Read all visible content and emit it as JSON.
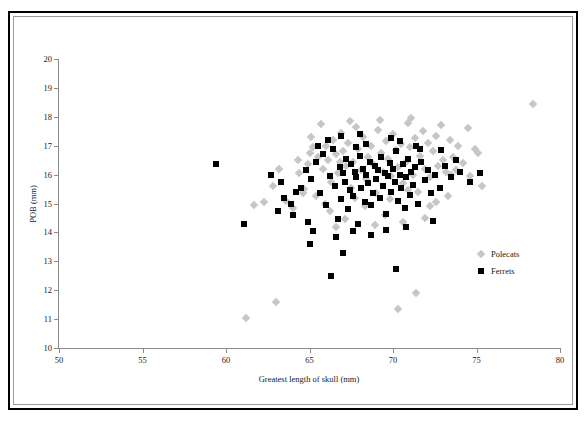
{
  "chart_data": {
    "type": "scatter",
    "title": "",
    "xlabel": "Greatest length of skull (mm)",
    "ylabel": "POB (mm)",
    "xlim": [
      50,
      80
    ],
    "ylim": [
      10,
      20
    ],
    "xticks": [
      50,
      55,
      60,
      65,
      70,
      75,
      80
    ],
    "yticks": [
      10,
      11,
      12,
      13,
      14,
      15,
      16,
      17,
      18,
      19,
      20
    ],
    "grid": false,
    "legend_position": "middle-right",
    "colors": {
      "polecats": "#c6c6c6",
      "ferrets": "#000000",
      "axis": "#8a8a8a",
      "frame": "#000000"
    },
    "series": [
      {
        "name": "Polecats",
        "marker": "diamond",
        "color": "#c6c6c6",
        "points": [
          [
            78.4,
            18.45
          ],
          [
            75.3,
            15.6
          ],
          [
            74.9,
            16.9
          ],
          [
            74.5,
            17.6
          ],
          [
            74.2,
            16.4
          ],
          [
            73.9,
            17.0
          ],
          [
            73.6,
            16.6
          ],
          [
            73.4,
            17.2
          ],
          [
            73.2,
            16.1
          ],
          [
            73.0,
            16.5
          ],
          [
            72.9,
            17.7
          ],
          [
            72.7,
            16.3
          ],
          [
            72.6,
            17.35
          ],
          [
            72.4,
            16.8
          ],
          [
            72.2,
            15.9
          ],
          [
            72.1,
            17.1
          ],
          [
            71.9,
            16.2
          ],
          [
            71.8,
            17.5
          ],
          [
            71.6,
            16.65
          ],
          [
            71.5,
            15.4
          ],
          [
            71.3,
            17.25
          ],
          [
            71.2,
            16.0
          ],
          [
            71.0,
            16.95
          ],
          [
            70.9,
            17.8
          ],
          [
            70.8,
            16.45
          ],
          [
            70.6,
            15.7
          ],
          [
            70.5,
            17.05
          ],
          [
            70.3,
            16.25
          ],
          [
            70.2,
            16.85
          ],
          [
            70.0,
            17.4
          ],
          [
            69.9,
            15.95
          ],
          [
            69.7,
            16.55
          ],
          [
            69.6,
            17.15
          ],
          [
            69.4,
            16.1
          ],
          [
            69.3,
            16.75
          ],
          [
            69.1,
            17.55
          ],
          [
            69.0,
            15.35
          ],
          [
            68.8,
            16.35
          ],
          [
            68.7,
            17.0
          ],
          [
            68.5,
            16.6
          ],
          [
            68.4,
            15.85
          ],
          [
            68.2,
            17.3
          ],
          [
            68.1,
            16.15
          ],
          [
            67.9,
            16.9
          ],
          [
            67.8,
            17.65
          ],
          [
            67.6,
            16.45
          ],
          [
            67.5,
            15.55
          ],
          [
            67.3,
            17.1
          ],
          [
            67.2,
            16.3
          ],
          [
            67.0,
            16.8
          ],
          [
            66.9,
            17.45
          ],
          [
            66.7,
            16.05
          ],
          [
            66.6,
            16.7
          ],
          [
            66.4,
            17.2
          ],
          [
            66.3,
            15.75
          ],
          [
            66.1,
            16.5
          ],
          [
            66.0,
            17.0
          ],
          [
            65.8,
            16.2
          ],
          [
            65.7,
            17.75
          ],
          [
            65.5,
            16.6
          ],
          [
            65.4,
            15.25
          ],
          [
            65.2,
            16.95
          ],
          [
            65.1,
            17.3
          ],
          [
            64.9,
            16.35
          ],
          [
            64.7,
            15.5
          ],
          [
            64.4,
            16.05
          ],
          [
            64.0,
            14.85
          ],
          [
            63.6,
            15.1
          ],
          [
            63.2,
            16.2
          ],
          [
            62.8,
            15.6
          ],
          [
            62.3,
            15.05
          ],
          [
            61.7,
            14.95
          ],
          [
            61.2,
            11.05
          ],
          [
            63.0,
            11.6
          ],
          [
            71.4,
            11.9
          ],
          [
            70.3,
            11.35
          ],
          [
            70.6,
            14.35
          ],
          [
            71.9,
            14.5
          ],
          [
            69.5,
            14.6
          ],
          [
            68.3,
            14.9
          ],
          [
            67.1,
            14.45
          ],
          [
            66.2,
            14.75
          ],
          [
            72.6,
            15.05
          ],
          [
            73.3,
            15.25
          ],
          [
            69.8,
            15.15
          ],
          [
            67.7,
            15.2
          ],
          [
            65.9,
            15.0
          ],
          [
            64.6,
            15.35
          ],
          [
            73.8,
            16.15
          ],
          [
            74.6,
            15.95
          ],
          [
            75.1,
            16.75
          ],
          [
            72.2,
            14.9
          ],
          [
            68.9,
            14.25
          ],
          [
            70.9,
            15.45
          ],
          [
            66.6,
            14.2
          ],
          [
            69.2,
            17.9
          ],
          [
            67.4,
            17.85
          ],
          [
            71.1,
            17.95
          ],
          [
            73.5,
            16.0
          ],
          [
            64.3,
            16.5
          ],
          [
            65.0,
            16.75
          ],
          [
            66.8,
            16.45
          ]
        ]
      },
      {
        "name": "Ferrets",
        "marker": "square",
        "color": "#000000",
        "points": [
          [
            59.4,
            16.35
          ],
          [
            61.1,
            14.3
          ],
          [
            62.7,
            16.0
          ],
          [
            63.1,
            14.75
          ],
          [
            63.5,
            15.2
          ],
          [
            64.0,
            14.6
          ],
          [
            64.5,
            15.55
          ],
          [
            64.8,
            16.15
          ],
          [
            65.1,
            15.85
          ],
          [
            65.4,
            16.45
          ],
          [
            65.6,
            15.35
          ],
          [
            65.8,
            16.7
          ],
          [
            66.0,
            14.95
          ],
          [
            66.2,
            15.95
          ],
          [
            66.4,
            16.9
          ],
          [
            66.5,
            15.6
          ],
          [
            66.7,
            14.45
          ],
          [
            66.8,
            16.25
          ],
          [
            66.9,
            15.15
          ],
          [
            67.0,
            16.05
          ],
          [
            67.1,
            15.75
          ],
          [
            67.2,
            16.55
          ],
          [
            67.3,
            14.8
          ],
          [
            67.4,
            15.45
          ],
          [
            67.5,
            16.35
          ],
          [
            67.6,
            15.25
          ],
          [
            67.7,
            16.1
          ],
          [
            67.8,
            15.9
          ],
          [
            67.9,
            14.3
          ],
          [
            68.0,
            16.65
          ],
          [
            68.1,
            15.55
          ],
          [
            68.2,
            16.2
          ],
          [
            68.3,
            15.05
          ],
          [
            68.4,
            16.0
          ],
          [
            68.5,
            15.7
          ],
          [
            68.6,
            16.45
          ],
          [
            68.7,
            14.95
          ],
          [
            68.8,
            15.35
          ],
          [
            68.9,
            16.3
          ],
          [
            69.0,
            15.85
          ],
          [
            69.1,
            16.15
          ],
          [
            69.2,
            15.2
          ],
          [
            69.3,
            16.6
          ],
          [
            69.4,
            15.6
          ],
          [
            69.5,
            16.05
          ],
          [
            69.6,
            14.65
          ],
          [
            69.7,
            15.95
          ],
          [
            69.8,
            16.4
          ],
          [
            69.9,
            15.4
          ],
          [
            70.0,
            16.2
          ],
          [
            70.1,
            15.75
          ],
          [
            70.2,
            16.8
          ],
          [
            70.3,
            15.1
          ],
          [
            70.4,
            16.0
          ],
          [
            70.5,
            15.55
          ],
          [
            70.6,
            16.35
          ],
          [
            70.7,
            14.85
          ],
          [
            70.8,
            15.9
          ],
          [
            70.9,
            16.55
          ],
          [
            71.0,
            15.3
          ],
          [
            71.1,
            16.1
          ],
          [
            71.2,
            15.65
          ],
          [
            71.3,
            16.25
          ],
          [
            71.5,
            15.0
          ],
          [
            71.7,
            16.45
          ],
          [
            71.9,
            15.8
          ],
          [
            72.1,
            16.15
          ],
          [
            72.3,
            15.35
          ],
          [
            72.5,
            16.0
          ],
          [
            72.8,
            15.55
          ],
          [
            73.1,
            16.3
          ],
          [
            73.5,
            15.9
          ],
          [
            74.0,
            16.1
          ],
          [
            74.6,
            15.75
          ],
          [
            75.2,
            16.05
          ],
          [
            66.3,
            12.5
          ],
          [
            70.2,
            12.75
          ],
          [
            67.0,
            13.3
          ],
          [
            65.2,
            14.05
          ],
          [
            66.6,
            13.85
          ],
          [
            68.7,
            13.9
          ],
          [
            69.6,
            14.1
          ],
          [
            64.9,
            14.35
          ],
          [
            63.9,
            15.0
          ],
          [
            65.5,
            17.0
          ],
          [
            66.9,
            17.35
          ],
          [
            68.4,
            17.05
          ],
          [
            70.4,
            17.15
          ],
          [
            71.6,
            16.9
          ],
          [
            72.9,
            16.85
          ],
          [
            64.2,
            15.4
          ],
          [
            63.3,
            15.75
          ],
          [
            67.6,
            14.05
          ],
          [
            70.8,
            14.2
          ],
          [
            72.4,
            14.4
          ],
          [
            65.0,
            13.6
          ],
          [
            68.0,
            17.4
          ],
          [
            69.9,
            17.25
          ],
          [
            73.8,
            16.5
          ],
          [
            66.1,
            17.2
          ],
          [
            67.8,
            16.95
          ],
          [
            71.4,
            17.0
          ]
        ]
      }
    ]
  },
  "legend": {
    "items": [
      {
        "label": "Polecats"
      },
      {
        "label": "Ferrets"
      }
    ]
  }
}
